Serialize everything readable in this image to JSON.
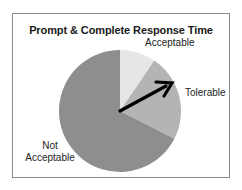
{
  "chart_data": {
    "type": "pie",
    "title": "Prompt & Complete Response Time",
    "categories": [
      "Acceptable",
      "Tolerable",
      "Not Acceptable"
    ],
    "values": [
      9.5,
      23,
      67.5
    ],
    "unit": "percent (estimated)",
    "colors": [
      "#e6e6e6",
      "#b4b4b4",
      "#8e8e8e"
    ],
    "start_angle_deg": 0,
    "direction": "clockwise",
    "annotations": [
      {
        "type": "arrow",
        "from": "pie-center",
        "to": "Tolerable slice edge",
        "color": "#000000"
      }
    ],
    "legend": "none (inline labels)"
  },
  "labels": {
    "title": "Prompt & Complete Response Time",
    "acceptable": "Acceptable",
    "tolerable": "Tolerable",
    "not_line1": "Not",
    "not_line2": "Acceptable"
  }
}
